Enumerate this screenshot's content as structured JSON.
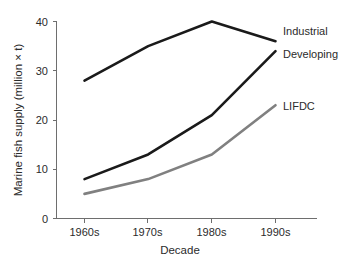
{
  "chart_data": {
    "type": "line",
    "title": "",
    "xlabel": "Decade",
    "ylabel": "Marine fish supply (million × t)",
    "categories": [
      "1960s",
      "1970s",
      "1980s",
      "1990s"
    ],
    "yticks": [
      "0",
      "10",
      "20",
      "30",
      "40"
    ],
    "ylim": [
      0,
      40
    ],
    "grid": false,
    "legend_position": "inline-right-of-line-ends",
    "series": [
      {
        "name": "Industrial",
        "values": [
          28,
          35,
          40,
          36
        ],
        "color": "#1a1a1a"
      },
      {
        "name": "Developing",
        "values": [
          8,
          13,
          21,
          34
        ],
        "color": "#1a1a1a"
      },
      {
        "name": "LIFDC",
        "values": [
          5,
          8,
          13,
          23
        ],
        "color": "#808080"
      }
    ]
  },
  "axes": {
    "y_title": "Marine fish supply (million × t)",
    "x_title": "Decade",
    "y_tick_labels": [
      "40",
      "30",
      "20",
      "10",
      "0"
    ],
    "x_tick_labels": [
      "1960s",
      "1970s",
      "1980s",
      "1990s"
    ]
  },
  "series_labels": {
    "industrial": "Industrial",
    "developing": "Developing",
    "lifdc": "LIFDC"
  }
}
